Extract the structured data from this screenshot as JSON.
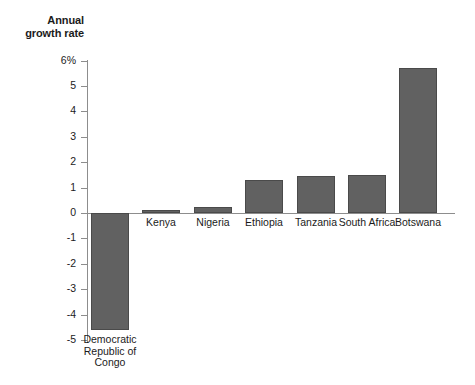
{
  "chart_data": {
    "type": "bar",
    "title": "Annual growth rate",
    "xlabel": "",
    "ylabel": "Annual growth rate",
    "ylim": [
      -5,
      6
    ],
    "grid": false,
    "legend": false,
    "orientation": "vertical",
    "bar_color": "#616161",
    "bar_border_color": "#4a4a4a",
    "axis_color": "#8d8d8d",
    "ytick_labels": [
      "6%",
      "5",
      "4",
      "3",
      "2",
      "1",
      "0",
      "-1",
      "-2",
      "-3",
      "-4",
      "-5"
    ],
    "ytick_values": [
      6,
      5,
      4,
      3,
      2,
      1,
      0,
      -1,
      -2,
      -3,
      -4,
      -5
    ],
    "categories": [
      "Democratic\nRepublic of\nCongo",
      "Kenya",
      "Nigeria",
      "Ethiopia",
      "Tanzania",
      "South Africa",
      "Botswana"
    ],
    "values": [
      -4.6,
      0.1,
      0.25,
      1.3,
      1.45,
      1.5,
      5.7
    ]
  },
  "title_lines": "Annual\ngrowth rate"
}
